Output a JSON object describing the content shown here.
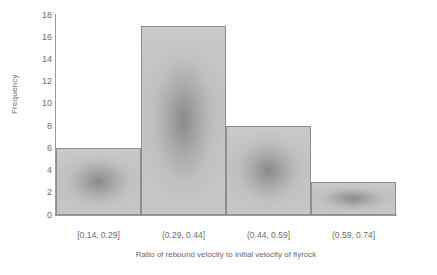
{
  "chart_data": {
    "type": "bar",
    "title": "",
    "subtitle": "",
    "xlabel": "Ratio of rebound velocity to initial velocity of flyrock",
    "ylabel": "Frequency",
    "categories": [
      "[0.14, 0.29]",
      "(0.29, 0.44]",
      "(0.44, 0.59]",
      "(0.59, 0.74]"
    ],
    "values": [
      6,
      17,
      8,
      3
    ],
    "ylim": [
      0,
      18
    ],
    "xlim": [
      0.14,
      0.74
    ],
    "y_ticks": [
      0,
      2,
      4,
      6,
      8,
      10,
      12,
      14,
      16,
      18
    ],
    "y_tick_labels": [
      "0",
      "2",
      "4",
      "6",
      "8",
      "10",
      "12",
      "14",
      "16",
      "18"
    ],
    "grid": false,
    "legend": false,
    "legend_position": "none",
    "bin_width": 0.15,
    "total_count": 34,
    "bar_colors": [
      "#c2c2c2",
      "#c2c2c2",
      "#c2c2c2",
      "#c2c2c2"
    ],
    "bar_edge_color": "#8d8d8d",
    "axis_color": "#9a9a9a",
    "text_color": "#6d6d6d",
    "background_color": "#ffffff"
  },
  "axes": {
    "y_title": "Frequency",
    "x_title": "Ratio of rebound velocity to initial velocity of flyrock"
  }
}
